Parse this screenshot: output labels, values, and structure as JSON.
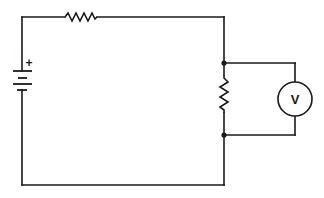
{
  "diagram": {
    "type": "series circuit with voltmeter",
    "components": {
      "battery": {
        "label_positive": "+",
        "label_negative": ""
      },
      "resistor_top": {
        "label": ""
      },
      "resistor_right": {
        "label": ""
      },
      "voltmeter": {
        "label": "V"
      }
    },
    "colors": {
      "ink": "#1a1a1a",
      "background": "#ffffff"
    }
  }
}
